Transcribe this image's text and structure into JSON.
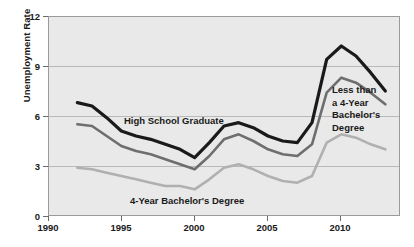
{
  "chart": {
    "title": "",
    "ylabel": "Unemployment Rate",
    "xlabel": "",
    "yticks": [
      "0",
      "3",
      "6",
      "9",
      "12"
    ],
    "xticks": [
      "1990",
      "1995",
      "2000",
      "2005",
      "2010"
    ],
    "annotations": {
      "high_school": "High School Graduate",
      "bachelors": "4-Year Bachelor's Degree",
      "less_than": "Less than\na 4-Year\nBachelor's\nDegree"
    },
    "colors": {
      "plot_background": "#e9e9e9",
      "gridline": "#b9b9b9",
      "frame": "#9a9a9a",
      "high_school_line": "#1a1a1a",
      "less_than_line": "#6e6e6e",
      "bachelors_line": "#b0b0b0",
      "text": "#1a1a1a"
    }
  },
  "chart_data": {
    "type": "line",
    "title": "",
    "xlabel": "",
    "ylabel": "Unemployment Rate",
    "xlim": [
      1990,
      2014
    ],
    "ylim": [
      0,
      12
    ],
    "xticks": [
      1990,
      1995,
      2000,
      2005,
      2010
    ],
    "yticks": [
      0,
      3,
      6,
      9,
      12
    ],
    "grid": true,
    "legend": "inline-annotations",
    "x": [
      1992,
      1993,
      1994,
      1995,
      1996,
      1997,
      1998,
      1999,
      2000,
      2001,
      2002,
      2003,
      2004,
      2005,
      2006,
      2007,
      2008,
      2009,
      2010,
      2011,
      2012,
      2013
    ],
    "series": [
      {
        "name": "High School Graduate",
        "color": "#1a1a1a",
        "values": [
          6.8,
          6.6,
          5.9,
          5.1,
          4.8,
          4.6,
          4.3,
          4.0,
          3.5,
          4.4,
          5.4,
          5.6,
          5.3,
          4.8,
          4.5,
          4.4,
          5.6,
          9.4,
          10.2,
          9.6,
          8.6,
          7.5
        ]
      },
      {
        "name": "Less than a 4-Year Bachelor's Degree",
        "color": "#6e6e6e",
        "values": [
          5.5,
          5.4,
          4.8,
          4.2,
          3.9,
          3.7,
          3.4,
          3.1,
          2.8,
          3.6,
          4.6,
          4.9,
          4.5,
          4.0,
          3.7,
          3.6,
          4.3,
          7.4,
          8.3,
          8.0,
          7.4,
          6.7
        ]
      },
      {
        "name": "4-Year Bachelor's Degree",
        "color": "#b0b0b0",
        "values": [
          2.9,
          2.8,
          2.6,
          2.4,
          2.2,
          2.0,
          1.8,
          1.8,
          1.6,
          2.2,
          2.9,
          3.1,
          2.8,
          2.4,
          2.1,
          2.0,
          2.4,
          4.4,
          4.9,
          4.7,
          4.3,
          4.0
        ]
      }
    ]
  }
}
